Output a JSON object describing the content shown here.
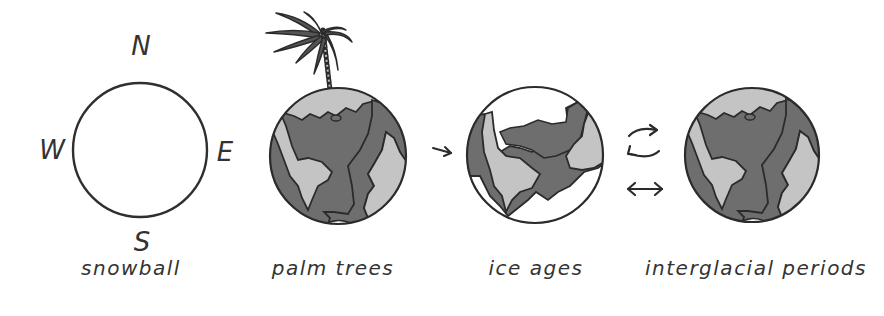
{
  "compass": {
    "north": "N",
    "west": "W",
    "east": "E",
    "south": "S"
  },
  "panels": [
    {
      "id": "snowball",
      "label": "snowball"
    },
    {
      "id": "palm-trees",
      "label": "palm trees"
    },
    {
      "id": "ice-ages",
      "label": "ice ages"
    },
    {
      "id": "interglacial-periods",
      "label": "interglacial periods"
    }
  ],
  "arrows": {
    "palm_to_ice": "right-arrow",
    "cycle": "cycle-arrows",
    "bidirectional": "left-right-arrow"
  },
  "colors": {
    "ocean": "#6e6e6e",
    "land": "#c4c4c4",
    "outline": "#2b2b2b",
    "ice": "#ffffff"
  }
}
